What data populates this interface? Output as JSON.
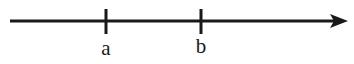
{
  "figure": {
    "kind": "number-line-diagram",
    "background_color": "#ffffff",
    "stroke_color": "#191919",
    "width": 354,
    "height": 64
  },
  "axis": {
    "name": "horizontal-number-line",
    "start_x": 10,
    "end_x": 348,
    "y": 21,
    "thickness": 3,
    "arrow_direction": "right",
    "arrowhead": {
      "name": "arrowhead-right",
      "tip_x": 348,
      "back_x": 330,
      "half_height": 7
    }
  },
  "ticks": [
    {
      "label": "a",
      "x": 106,
      "top_y": 9,
      "bottom_y": 34,
      "thickness": 3,
      "label_x": 106,
      "label_y": 58
    },
    {
      "label": "b",
      "x": 201,
      "top_y": 9,
      "bottom_y": 34,
      "thickness": 3,
      "label_x": 201,
      "label_y": 58
    }
  ],
  "labels": {
    "tick_a": "a",
    "tick_b": "b"
  },
  "chart_data": {
    "type": "line",
    "title": "",
    "subtitle": "",
    "xlabel": "",
    "ylabel": "",
    "categories": [
      "a",
      "b"
    ],
    "values": [
      106,
      201
    ],
    "x": [
      106,
      201
    ],
    "tick_labels": [
      "a",
      "b"
    ],
    "legend": [],
    "annotations": [],
    "axis_range_px": [
      10,
      348
    ],
    "grid": false,
    "legend_position": "none",
    "orientation": "horizontal",
    "arrow_direction": "right"
  }
}
